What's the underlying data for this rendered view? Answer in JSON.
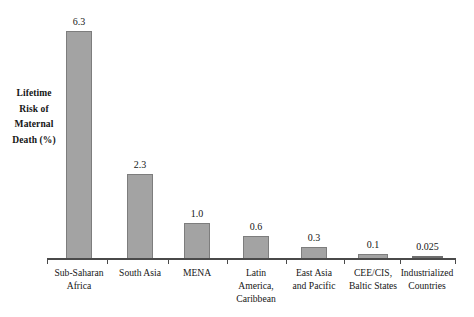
{
  "chart_data": {
    "type": "bar",
    "title": "",
    "subtitle": "",
    "xlabel": "",
    "ylabel": "Lifetime Risk of Maternal Death (%)",
    "ylabel_lines": [
      "Lifetime",
      "Risk of",
      "Maternal",
      "Death (%)"
    ],
    "categories": [
      "Sub-Saharan Africa",
      "South Asia",
      "MENA",
      "Latin America, Caribbean",
      "East Asia and Pacific",
      "CEE/CIS, Baltic States",
      "Industrialized Countries"
    ],
    "category_lines": [
      [
        "Sub-Saharan",
        "Africa"
      ],
      [
        "South Asia"
      ],
      [
        "MENA"
      ],
      [
        "Latin",
        "America,",
        "Caribbean"
      ],
      [
        "East Asia",
        "and Pacific"
      ],
      [
        "CEE/CIS,",
        "Baltic States"
      ],
      [
        "Industrialized",
        "Countries"
      ]
    ],
    "values": [
      6.3,
      2.3,
      1.0,
      0.6,
      0.3,
      0.1,
      0.025
    ],
    "value_labels": [
      "6.3",
      "2.3",
      "1.0",
      "0.6",
      "0.3",
      "0.1",
      "0.025"
    ],
    "ylim": [
      0,
      6.3
    ],
    "grid": false,
    "legend": false,
    "legend_position": "none",
    "colors": {
      "bar_fill": "#a3a3a3",
      "bar_border": "#7d7d7d",
      "axis": "#4a4a4a",
      "text": "#161616",
      "background": "#ffffff"
    }
  },
  "layout": {
    "bars": [
      {
        "index": 0,
        "left": 66,
        "width": 26,
        "height": 228,
        "thin": false,
        "tick_left": 47
      },
      {
        "index": 1,
        "left": 127,
        "width": 26,
        "height": 85,
        "thin": false,
        "tick_left": 107
      },
      {
        "index": 2,
        "left": 184,
        "width": 26,
        "height": 36,
        "thin": false,
        "tick_left": 168
      },
      {
        "index": 3,
        "left": 243,
        "width": 26,
        "height": 23,
        "thin": false,
        "tick_left": 227
      },
      {
        "index": 4,
        "left": 301,
        "width": 26,
        "height": 12,
        "thin": false,
        "tick_left": 286
      },
      {
        "index": 5,
        "left": 358,
        "width": 30,
        "height": 5,
        "thin": false,
        "tick_left": 344
      },
      {
        "index": 6,
        "left": 412,
        "width": 31,
        "height": 3,
        "thin": true,
        "tick_left": 400
      }
    ],
    "end_tick_left": 455,
    "cat_label_centers": [
      79,
      140,
      197,
      256,
      314,
      373,
      427
    ]
  }
}
